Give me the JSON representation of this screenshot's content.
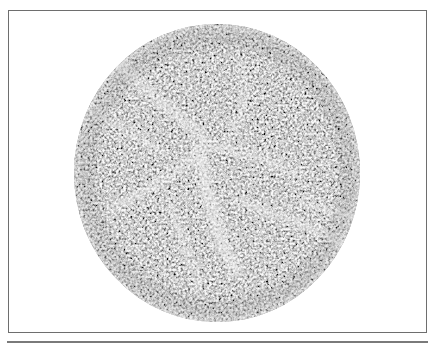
{
  "figure": {
    "kind": "circular grayscale microscopy-style image in a rectangular frame",
    "frame_color": "#6e6e6e",
    "rule_color": "#7a7a7a",
    "disc": {
      "center_x": 217,
      "center_y": 173,
      "radius_x": 143,
      "radius_y": 149,
      "base_tone": "#9a9a9a",
      "light_tone": "#e6e6e6",
      "dark_tone": "#3c3c3c"
    },
    "text": ""
  }
}
